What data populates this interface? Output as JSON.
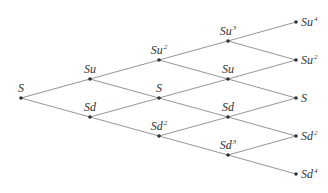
{
  "diagram": {
    "colors": {
      "edge": "#8a8a8a",
      "node": "#333333",
      "text": "#333333",
      "background": "#ffffff"
    },
    "nodes": [
      {
        "id": "n0_0",
        "level": 0,
        "x": 21,
        "y": 98,
        "base": "S",
        "exp": "",
        "label_pos": "above"
      },
      {
        "id": "n1_0",
        "level": 1,
        "x": 90,
        "y": 79,
        "base": "Su",
        "exp": "",
        "label_pos": "above"
      },
      {
        "id": "n1_1",
        "level": 1,
        "x": 90,
        "y": 117,
        "base": "Sd",
        "exp": "",
        "label_pos": "above"
      },
      {
        "id": "n2_0",
        "level": 2,
        "x": 159,
        "y": 60,
        "base": "Su",
        "exp": "2",
        "label_pos": "above"
      },
      {
        "id": "n2_1",
        "level": 2,
        "x": 159,
        "y": 98,
        "base": "S",
        "exp": "",
        "label_pos": "above"
      },
      {
        "id": "n2_2",
        "level": 2,
        "x": 159,
        "y": 136,
        "base": "Sd",
        "exp": "2",
        "label_pos": "above"
      },
      {
        "id": "n3_0",
        "level": 3,
        "x": 228,
        "y": 41,
        "base": "Su",
        "exp": "3",
        "label_pos": "above"
      },
      {
        "id": "n3_1",
        "level": 3,
        "x": 228,
        "y": 79,
        "base": "Su",
        "exp": "",
        "label_pos": "above"
      },
      {
        "id": "n3_2",
        "level": 3,
        "x": 228,
        "y": 117,
        "base": "Sd",
        "exp": "",
        "label_pos": "above"
      },
      {
        "id": "n3_3",
        "level": 3,
        "x": 228,
        "y": 155,
        "base": "Sd",
        "exp": "3",
        "label_pos": "above"
      },
      {
        "id": "n4_0",
        "level": 4,
        "x": 296,
        "y": 22,
        "base": "Su",
        "exp": "4",
        "label_pos": "right"
      },
      {
        "id": "n4_1",
        "level": 4,
        "x": 296,
        "y": 60,
        "base": "Su",
        "exp": "2",
        "label_pos": "right"
      },
      {
        "id": "n4_2",
        "level": 4,
        "x": 296,
        "y": 98,
        "base": "S",
        "exp": "",
        "label_pos": "right"
      },
      {
        "id": "n4_3",
        "level": 4,
        "x": 296,
        "y": 136,
        "base": "Sd",
        "exp": "2",
        "label_pos": "right"
      },
      {
        "id": "n4_4",
        "level": 4,
        "x": 296,
        "y": 174,
        "base": "Sd",
        "exp": "4",
        "label_pos": "right"
      }
    ],
    "edges": [
      [
        "n0_0",
        "n1_0"
      ],
      [
        "n0_0",
        "n1_1"
      ],
      [
        "n1_0",
        "n2_0"
      ],
      [
        "n1_0",
        "n2_1"
      ],
      [
        "n1_1",
        "n2_1"
      ],
      [
        "n1_1",
        "n2_2"
      ],
      [
        "n2_0",
        "n3_0"
      ],
      [
        "n2_0",
        "n3_1"
      ],
      [
        "n2_1",
        "n3_1"
      ],
      [
        "n2_1",
        "n3_2"
      ],
      [
        "n2_2",
        "n3_2"
      ],
      [
        "n2_2",
        "n3_3"
      ],
      [
        "n3_0",
        "n4_0"
      ],
      [
        "n3_0",
        "n4_1"
      ],
      [
        "n3_1",
        "n4_1"
      ],
      [
        "n3_1",
        "n4_2"
      ],
      [
        "n3_2",
        "n4_2"
      ],
      [
        "n3_2",
        "n4_3"
      ],
      [
        "n3_3",
        "n4_3"
      ],
      [
        "n3_3",
        "n4_4"
      ]
    ]
  }
}
